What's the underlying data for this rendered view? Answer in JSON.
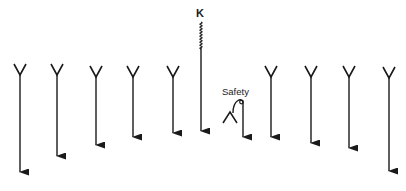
{
  "diagram": {
    "ink_color": "#1a1a1a",
    "background": "#ffffff",
    "labels": {
      "k": "K",
      "safety": "Safety"
    },
    "players": [
      {
        "id": "p1",
        "x": 20,
        "v_top": 64,
        "arrow_end": 181
      },
      {
        "id": "p2",
        "x": 57,
        "v_top": 64,
        "arrow_end": 165
      },
      {
        "id": "p3",
        "x": 96,
        "v_top": 66,
        "arrow_end": 154
      },
      {
        "id": "p4",
        "x": 133,
        "v_top": 66,
        "arrow_end": 146
      },
      {
        "id": "p5",
        "x": 173,
        "v_top": 66,
        "arrow_end": 142
      },
      {
        "id": "p7",
        "x": 271,
        "v_top": 66,
        "arrow_end": 146
      },
      {
        "id": "p8",
        "x": 311,
        "v_top": 66,
        "arrow_end": 152
      },
      {
        "id": "p9",
        "x": 349,
        "v_top": 66,
        "arrow_end": 157
      },
      {
        "id": "p10",
        "x": 389,
        "v_top": 67,
        "arrow_end": 180
      }
    ],
    "kicker": {
      "x": 201,
      "label_y": 11,
      "squiggle_top": 22,
      "squiggle_bottom": 48,
      "arrow_end": 140
    },
    "safety": {
      "x": 243,
      "hook_top": 99,
      "arrow_end": 146,
      "label_x": 222,
      "label_y": 86
    }
  }
}
